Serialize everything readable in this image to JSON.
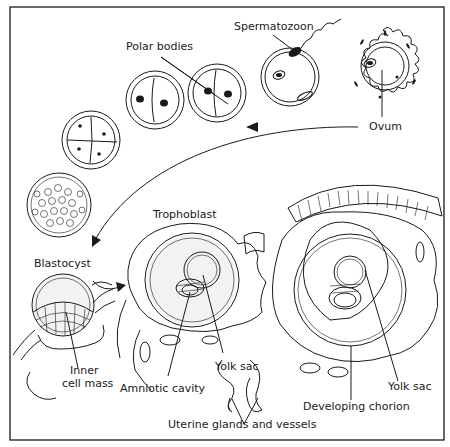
{
  "figure": {
    "labels": {
      "spermatozoon": "Spermatozoon",
      "polar_bodies": "Polar bodies",
      "ovum": "Ovum",
      "trophoblast": "Trophoblast",
      "blastocyst": "Blastocyst",
      "inner_cell_mass_1": "Inner",
      "inner_cell_mass_2": "cell mass",
      "yolk_sac_1": "Yolk sac",
      "amniotic_cavity": "Amniotic cavity",
      "yolk_sac_2": "Yolk sac",
      "developing_chorion": "Developing chorion",
      "uterine_glands": "Uterine glands and vessels"
    },
    "colors": {
      "ink": "#1a1a1a",
      "background": "#ffffff",
      "stipple": "#f2f2f2"
    }
  }
}
